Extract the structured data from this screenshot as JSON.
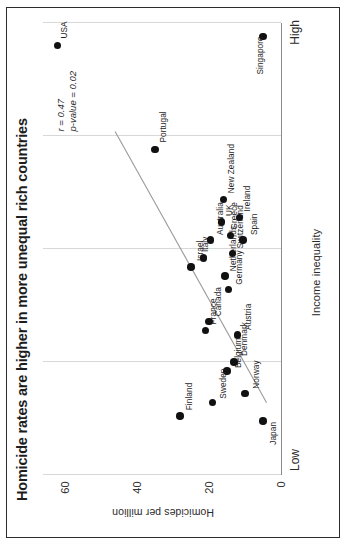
{
  "chart_data": {
    "type": "scatter",
    "title": "Homicide rates are higher in more unequal rich countries",
    "xlabel": "Income inequality",
    "ylabel": "Homicides per million",
    "x_axis_low_label": "Low",
    "x_axis_high_label": "High",
    "xlim": [
      0,
      100
    ],
    "ylim": [
      0,
      66
    ],
    "y_ticks": [
      0,
      20,
      40,
      60
    ],
    "y_tick_labels": [
      "0",
      "20",
      "40",
      "60"
    ],
    "x_gridlines": [
      0,
      25,
      50,
      75,
      100
    ],
    "grid": "vertical",
    "legend": "none",
    "point_color": "#111111",
    "trendline_color": "#9a9a9a",
    "annotations": {
      "r_label": "r = 0.47",
      "p_value_label": "p-value = 0.02"
    },
    "points": [
      {
        "name": "USA",
        "x": 95.0,
        "y": 62.0,
        "label_dx": 7,
        "label_dy": 3
      },
      {
        "name": "Singapore",
        "x": 97.0,
        "y": 5.0,
        "label_dx": -38,
        "label_dy": -7
      },
      {
        "name": "Portugal",
        "x": 72.0,
        "y": 35.0,
        "label_dx": 7,
        "label_dy": 4
      },
      {
        "name": "Israel",
        "x": 46.0,
        "y": 25.0,
        "label_dx": 6,
        "label_dy": 5
      },
      {
        "name": "Finland",
        "x": 13.0,
        "y": 28.0,
        "label_dx": 6,
        "label_dy": 5
      },
      {
        "name": "France",
        "x": 32.0,
        "y": 21.0,
        "label_dx": 6,
        "label_dy": 4
      },
      {
        "name": "Italy",
        "x": 48.0,
        "y": 21.5,
        "label_dx": 6,
        "label_dy": -2
      },
      {
        "name": "Australia",
        "x": 52.0,
        "y": 19.5,
        "label_dx": 5,
        "label_dy": 5
      },
      {
        "name": "UK",
        "x": 56.0,
        "y": 16.5,
        "label_dx": 6,
        "label_dy": 3
      },
      {
        "name": "New Zealand",
        "x": 61.0,
        "y": 16.0,
        "label_dx": 6,
        "label_dy": 4
      },
      {
        "name": "Greece",
        "x": 53.0,
        "y": 14.0,
        "label_dx": 6,
        "label_dy": -1
      },
      {
        "name": "Canada",
        "x": 34.0,
        "y": 20.0,
        "label_dx": 5,
        "label_dy": 5
      },
      {
        "name": "Netherlands",
        "x": 44.0,
        "y": 15.5,
        "label_dx": 5,
        "label_dy": 4
      },
      {
        "name": "Switzerland",
        "x": 49.0,
        "y": 13.5,
        "label_dx": 5,
        "label_dy": 4
      },
      {
        "name": "Ireland",
        "x": 57.0,
        "y": 11.5,
        "label_dx": 6,
        "label_dy": 3
      },
      {
        "name": "Germany",
        "x": 41.0,
        "y": 14.5,
        "label_dx": 5,
        "label_dy": 6
      },
      {
        "name": "Spain",
        "x": 52.0,
        "y": 10.5,
        "label_dx": 5,
        "label_dy": 7
      },
      {
        "name": "Austria",
        "x": 31.0,
        "y": 12.0,
        "label_dx": 5,
        "label_dy": 6
      },
      {
        "name": "Belgium",
        "x": 23.0,
        "y": 15.0,
        "label_dx": 3,
        "label_dy": 7
      },
      {
        "name": "Denmark",
        "x": 25.0,
        "y": 13.0,
        "label_dx": 6,
        "label_dy": 6
      },
      {
        "name": "Sweden",
        "x": 16.0,
        "y": 19.0,
        "label_dx": 4,
        "label_dy": 7
      },
      {
        "name": "Norway",
        "x": 18.0,
        "y": 10.0,
        "label_dx": 5,
        "label_dy": 7
      },
      {
        "name": "Japan",
        "x": 12.0,
        "y": 5.0,
        "label_dx": -24,
        "label_dy": 6
      }
    ],
    "trendline": {
      "x1": 16.0,
      "y1": 4.0,
      "x2": 76.0,
      "y2": 46.0
    }
  }
}
